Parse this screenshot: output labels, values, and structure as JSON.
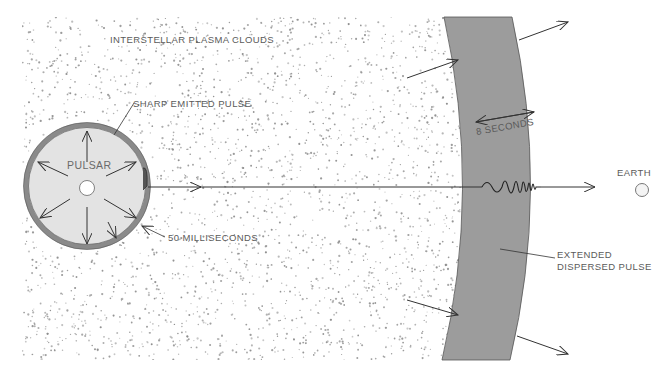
{
  "diagram": {
    "type": "pulsar-signal-dispersion",
    "colors": {
      "background": "#ffffff",
      "plasma_dots": "#8a8a8a",
      "pulsar_fill": "#e4e4e4",
      "pulsar_ring": "#8c8c8c",
      "shell_fill": "#9a9a9a",
      "line": "#333333",
      "label_text": "#5a5a5a"
    },
    "labels": {
      "plasma": "INTERSTELLAR PLASMA CLOUDS",
      "sharp_pulse": "SHARP EMITTED PULSE",
      "pulsar": "PULSAR",
      "pulse_width_short": "50 MILLISECONDS",
      "pulse_width_long": "8 SECONDS",
      "earth": "EARTH",
      "dispersed_line1": "EXTENDED",
      "dispersed_line2": "DISPERSED PULSE"
    },
    "nodes": [
      {
        "id": "pulsar",
        "label": "PULSAR",
        "shape": "circle"
      },
      {
        "id": "plasma",
        "label": "INTERSTELLAR PLASMA CLOUDS",
        "shape": "dotted-region"
      },
      {
        "id": "shell",
        "label": "EXTENDED DISPERSED PULSE",
        "shape": "curved-band"
      },
      {
        "id": "earth",
        "label": "EARTH",
        "shape": "small-circle"
      }
    ],
    "edges": [
      {
        "from": "pulsar",
        "to": "earth",
        "style": "arrow",
        "note": "signal path through plasma"
      }
    ]
  }
}
